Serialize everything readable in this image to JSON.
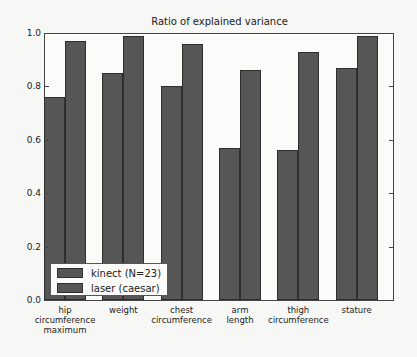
{
  "chart_data": {
    "type": "bar",
    "title": "Ratio of explained variance",
    "xlabel": "",
    "ylabel": "",
    "ylim": [
      0.0,
      1.0
    ],
    "yticks": [
      "0.0",
      "0.2",
      "0.4",
      "0.6",
      "0.8",
      "1.0"
    ],
    "grid": false,
    "legend_position": "lower left",
    "categories": [
      "hip\ncircumference\nmaximum",
      "weight",
      "chest\ncircumference",
      "arm\nlength",
      "thigh\ncircumference",
      "stature"
    ],
    "series": [
      {
        "name": "kinect (N=23)",
        "color": "#565656",
        "values": [
          0.76,
          0.85,
          0.8,
          0.57,
          0.56,
          0.87
        ]
      },
      {
        "name": "laser (caesar)",
        "color": "#565656",
        "values": [
          0.97,
          0.99,
          0.96,
          0.86,
          0.93,
          0.99
        ]
      }
    ]
  }
}
